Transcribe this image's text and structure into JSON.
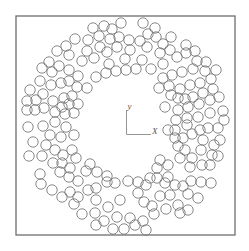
{
  "figure": {
    "frame": {
      "x": 16,
      "y": 16,
      "width": 219,
      "height": 219
    },
    "axes": {
      "origin": [
        126.5,
        134.5
      ],
      "x_end": [
        151,
        134.5
      ],
      "y_end": [
        126.5,
        110
      ],
      "x_label": "X",
      "y_label": "y"
    },
    "particle_radius": 5.2,
    "particles": [
      [
        104,
        26
      ],
      [
        121,
        23
      ],
      [
        143,
        23
      ],
      [
        155,
        28
      ],
      [
        93,
        28
      ],
      [
        112,
        29
      ],
      [
        99,
        36
      ],
      [
        110,
        39
      ],
      [
        119,
        37
      ],
      [
        129,
        40
      ],
      [
        140,
        41
      ],
      [
        148,
        34
      ],
      [
        156,
        37
      ],
      [
        171,
        37
      ],
      [
        163,
        44
      ],
      [
        88,
        40
      ],
      [
        75,
        39
      ],
      [
        66,
        46
      ],
      [
        57,
        51
      ],
      [
        69,
        55
      ],
      [
        87,
        51
      ],
      [
        100,
        47
      ],
      [
        107,
        52
      ],
      [
        117,
        47
      ],
      [
        130,
        50
      ],
      [
        147,
        47
      ],
      [
        160,
        53
      ],
      [
        170,
        50
      ],
      [
        186,
        45
      ],
      [
        195,
        51
      ],
      [
        177,
        57
      ],
      [
        186,
        53
      ],
      [
        197,
        61
      ],
      [
        206,
        62
      ],
      [
        82,
        61
      ],
      [
        94,
        58
      ],
      [
        109,
        64
      ],
      [
        125,
        59
      ],
      [
        142,
        60
      ],
      [
        151,
        69
      ],
      [
        163,
        64
      ],
      [
        136,
        69
      ],
      [
        126,
        70
      ],
      [
        116,
        71
      ],
      [
        106,
        73
      ],
      [
        96,
        77
      ],
      [
        87,
        88
      ],
      [
        78,
        76
      ],
      [
        69,
        70
      ],
      [
        59,
        66
      ],
      [
        49,
        62
      ],
      [
        42,
        68
      ],
      [
        52,
        72
      ],
      [
        40,
        81
      ],
      [
        51,
        85
      ],
      [
        61,
        83
      ],
      [
        69,
        81
      ],
      [
        77,
        87
      ],
      [
        30,
        90
      ],
      [
        43,
        94
      ],
      [
        53,
        101
      ],
      [
        64,
        98
      ],
      [
        72,
        96
      ],
      [
        78,
        104
      ],
      [
        69,
        104
      ],
      [
        62,
        107
      ],
      [
        55,
        112
      ],
      [
        65,
        114
      ],
      [
        74,
        113
      ],
      [
        36,
        100
      ],
      [
        27,
        101
      ],
      [
        27,
        110
      ],
      [
        35,
        110
      ],
      [
        44,
        108
      ],
      [
        28,
        127
      ],
      [
        43,
        126
      ],
      [
        55,
        122
      ],
      [
        66,
        127
      ],
      [
        74,
        135
      ],
      [
        50,
        135
      ],
      [
        61,
        137
      ],
      [
        33,
        142
      ],
      [
        46,
        145
      ],
      [
        55,
        150
      ],
      [
        63,
        155
      ],
      [
        72,
        150
      ],
      [
        76,
        158
      ],
      [
        29,
        156
      ],
      [
        42,
        156
      ],
      [
        53,
        163
      ],
      [
        62,
        163
      ],
      [
        70,
        168
      ],
      [
        40,
        174
      ],
      [
        41,
        184
      ],
      [
        60,
        172
      ],
      [
        69,
        177
      ],
      [
        78,
        181
      ],
      [
        86,
        171
      ],
      [
        97,
        172
      ],
      [
        107,
        176
      ],
      [
        90,
        164
      ],
      [
        52,
        190
      ],
      [
        62,
        197
      ],
      [
        70,
        192
      ],
      [
        78,
        197
      ],
      [
        88,
        190
      ],
      [
        96,
        188
      ],
      [
        107,
        182
      ],
      [
        115,
        183
      ],
      [
        96,
        200
      ],
      [
        74,
        204
      ],
      [
        82,
        214
      ],
      [
        95,
        213
      ],
      [
        108,
        207
      ],
      [
        120,
        200
      ],
      [
        128,
        181
      ],
      [
        138,
        182
      ],
      [
        146,
        185
      ],
      [
        138,
        193
      ],
      [
        144,
        202
      ],
      [
        152,
        206
      ],
      [
        160,
        196
      ],
      [
        170,
        195
      ],
      [
        165,
        183
      ],
      [
        157,
        178
      ],
      [
        168,
        177
      ],
      [
        175,
        185
      ],
      [
        183,
        186
      ],
      [
        191,
        181
      ],
      [
        188,
        194
      ],
      [
        178,
        205
      ],
      [
        166,
        209
      ],
      [
        154,
        214
      ],
      [
        143,
        221
      ],
      [
        130,
        218
      ],
      [
        117,
        217
      ],
      [
        104,
        221
      ],
      [
        113,
        229
      ],
      [
        124,
        229
      ],
      [
        135,
        225
      ],
      [
        146,
        230
      ],
      [
        96,
        225
      ],
      [
        188,
        210
      ],
      [
        180,
        213
      ],
      [
        198,
        198
      ],
      [
        201,
        182
      ],
      [
        211,
        183
      ],
      [
        202,
        165
      ],
      [
        210,
        165
      ],
      [
        218,
        156
      ],
      [
        214,
        145
      ],
      [
        220,
        140
      ],
      [
        201,
        150
      ],
      [
        190,
        167
      ],
      [
        180,
        158
      ],
      [
        178,
        146
      ],
      [
        175,
        138
      ],
      [
        183,
        138
      ],
      [
        192,
        134
      ],
      [
        200,
        130
      ],
      [
        208,
        128
      ],
      [
        218,
        128
      ],
      [
        224,
        120
      ],
      [
        223,
        111
      ],
      [
        210,
        113
      ],
      [
        198,
        117
      ],
      [
        187,
        118
      ],
      [
        176,
        120
      ],
      [
        178,
        110
      ],
      [
        188,
        107
      ],
      [
        199,
        104
      ],
      [
        210,
        100
      ],
      [
        219,
        97
      ],
      [
        213,
        89
      ],
      [
        203,
        93
      ],
      [
        193,
        97
      ],
      [
        185,
        99
      ],
      [
        178,
        98
      ],
      [
        171,
        95
      ],
      [
        169,
        86
      ],
      [
        180,
        89
      ],
      [
        190,
        85
      ],
      [
        200,
        83
      ],
      [
        211,
        79
      ],
      [
        216,
        70
      ],
      [
        205,
        71
      ],
      [
        193,
        69
      ],
      [
        182,
        72
      ],
      [
        172,
        75
      ],
      [
        163,
        78
      ],
      [
        159,
        88
      ],
      [
        165,
        107
      ],
      [
        168,
        130
      ],
      [
        175,
        130
      ],
      [
        185,
        150
      ],
      [
        192,
        158
      ],
      [
        203,
        140
      ],
      [
        212,
        155
      ],
      [
        187,
        125
      ],
      [
        157,
        168
      ],
      [
        168,
        165
      ],
      [
        150,
        178
      ],
      [
        160,
        160
      ]
    ]
  }
}
